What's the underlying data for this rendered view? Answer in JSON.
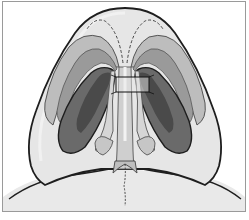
{
  "figure": {
    "description": "Basal view of nose showing lower lateral cartilages with medial crura sutured together",
    "colors": {
      "skin": "#e6e6e6",
      "skin_light": "#f2f2f2",
      "outline": "#1e1e1e",
      "cartilage_outer": "#bdbdbd",
      "cartilage_mid": "#9a9a9a",
      "nostril_dark": "#6a6a6a",
      "nostril_darker": "#4a4a4a",
      "columella": "#cfcfcf",
      "suture": "#111111",
      "frame_border": "#9a9a9a"
    },
    "labels": {
      "structure_nose": "nasal base",
      "structure_nostril_left": "left nostril",
      "structure_nostril_right": "right nostril",
      "structure_suture": "transdomal suture",
      "structure_columella": "columella",
      "structure_lip": "upper lip"
    }
  }
}
